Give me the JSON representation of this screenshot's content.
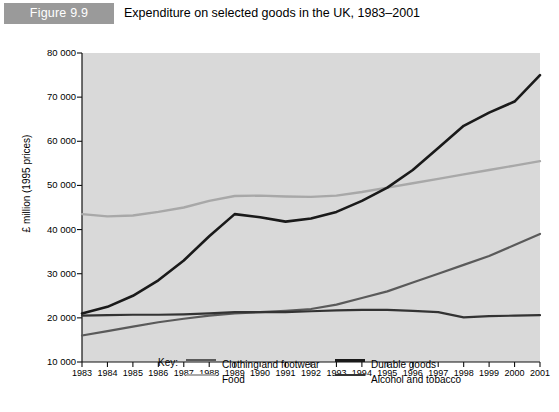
{
  "header": {
    "figure_number": "Figure 9.9",
    "title": "Expenditure on selected goods in the UK, 1983–2001",
    "banner_color": "#9a9a9a"
  },
  "legend": {
    "key_label": "Key:",
    "items": [
      {
        "label": "Clothing and footwear",
        "color": "#5a5a5a",
        "width": 2.2
      },
      {
        "label": "Food",
        "color": "#a8a8a8",
        "width": 2.4
      },
      {
        "label": "Durable goods",
        "color": "#1a1a1a",
        "width": 2.6
      },
      {
        "label": "Alcohol and tobacco",
        "color": "#333333",
        "width": 2.2
      }
    ]
  },
  "axes": {
    "ylabel": "£ million (1995 prices)",
    "yticks": [
      "80 000",
      "70 000",
      "60 000",
      "50 000",
      "40 000",
      "30 000",
      "20 000",
      "10 000"
    ],
    "ytick_values": [
      80000,
      70000,
      60000,
      50000,
      40000,
      30000,
      20000,
      10000
    ],
    "xticks": [
      "1983",
      "1984",
      "1985",
      "1986",
      "1987",
      "1988",
      "1989",
      "1990",
      "1991",
      "1992",
      "1993",
      "1994",
      "1995",
      "1996",
      "1997",
      "1998",
      "1999",
      "2000",
      "2001"
    ],
    "plot_background": "#d9d9d9"
  },
  "chart_data": {
    "type": "line",
    "title": "Expenditure on selected goods in the UK, 1983–2001",
    "xlabel": "",
    "ylabel": "£ million (1995 prices)",
    "x": [
      1983,
      1984,
      1985,
      1986,
      1987,
      1988,
      1989,
      1990,
      1991,
      1992,
      1993,
      1994,
      1995,
      1996,
      1997,
      1998,
      1999,
      2000,
      2001
    ],
    "xlim": [
      1983,
      2001
    ],
    "ylim": [
      10000,
      80000
    ],
    "grid": false,
    "legend_position": "bottom",
    "series": [
      {
        "name": "Clothing and footwear",
        "color": "#5a5a5a",
        "values": [
          16000,
          17000,
          18000,
          19000,
          19800,
          20500,
          21000,
          21300,
          21600,
          22000,
          23000,
          24500,
          26000,
          28000,
          30000,
          32000,
          34000,
          36500,
          39000
        ]
      },
      {
        "name": "Food",
        "color": "#a8a8a8",
        "values": [
          43500,
          43000,
          43200,
          44000,
          45000,
          46500,
          47600,
          47700,
          47500,
          47400,
          47700,
          48500,
          49500,
          50500,
          51500,
          52500,
          53500,
          54500,
          55500
        ]
      },
      {
        "name": "Durable goods",
        "color": "#1a1a1a",
        "values": [
          21000,
          22500,
          25000,
          28500,
          33000,
          38500,
          43500,
          42800,
          41800,
          42500,
          44000,
          46500,
          49500,
          53500,
          58500,
          63500,
          66500,
          69000,
          75000
        ]
      },
      {
        "name": "Alcohol and tobacco",
        "color": "#333333",
        "values": [
          20500,
          20600,
          20700,
          20700,
          20800,
          21000,
          21300,
          21300,
          21300,
          21500,
          21700,
          21800,
          21800,
          21600,
          21300,
          20100,
          20400,
          20500,
          20600
        ]
      }
    ]
  }
}
